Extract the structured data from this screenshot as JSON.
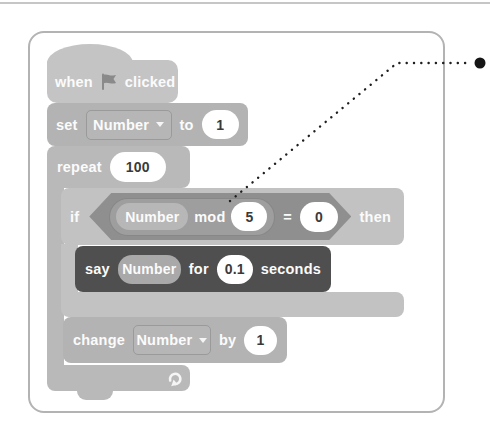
{
  "script": {
    "when_block": {
      "word_when": "when",
      "word_clicked": "clicked",
      "flag_icon": "green-flag"
    },
    "set_block": {
      "label": "set",
      "variable": "Number",
      "to": "to",
      "value": "1"
    },
    "repeat_block": {
      "label": "repeat",
      "count": "100",
      "loop_icon": "loop-arrow"
    },
    "if_block": {
      "label": "if",
      "then": "then"
    },
    "condition": {
      "mod_variable": "Number",
      "mod_label": "mod",
      "mod_value": "5",
      "equals_sign": "=",
      "compare_value": "0"
    },
    "say_block": {
      "label": "say",
      "variable": "Number",
      "for": "for",
      "duration": "0.1",
      "unit": "seconds"
    },
    "change_block": {
      "label": "change",
      "variable": "Number",
      "by": "by",
      "value": "1"
    }
  },
  "annotation": {
    "style": "dotted-callout-line-with-bullet",
    "target": "mod-operator-block"
  },
  "colors": {
    "panel_border": "#b3b3b3",
    "hat_block": "#c4c4c4",
    "stack_block": "#b3b3b3",
    "repeat_block": "#b9b9b9",
    "if_block": "#c2c2c2",
    "boolean_hexagon": "#8f8f8f",
    "mod_reporter": "#9e9e9e",
    "variable_pill": "#b7b7b7",
    "say_block": "#4f4f4f",
    "input_oval": "#ffffff",
    "callout": "#1f1f1f"
  }
}
